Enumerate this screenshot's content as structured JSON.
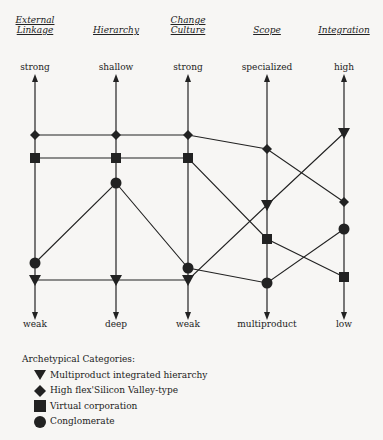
{
  "axes": [
    {
      "header": "External Linkage",
      "header_lines": [
        "External",
        "Linkage"
      ],
      "top": "strong",
      "bottom": "weak"
    },
    {
      "header": "Hierarchy",
      "header_lines": [
        "",
        "Hierarchy"
      ],
      "top": "shallow",
      "bottom": "deep"
    },
    {
      "header": "Change Culture",
      "header_lines": [
        "Change",
        "Culture"
      ],
      "top": "strong",
      "bottom": "weak"
    },
    {
      "header": "Scope",
      "header_lines": [
        "",
        "Scope"
      ],
      "top": "specialized",
      "bottom": "multiproduct"
    },
    {
      "header": "Integration",
      "header_lines": [
        "",
        "Integration"
      ],
      "top": "high",
      "bottom": "low"
    }
  ],
  "legend": {
    "title": "Archetypical Categories:",
    "items": [
      {
        "marker": "triangle-down",
        "label": "Multiproduct integrated hierarchy"
      },
      {
        "marker": "diamond",
        "label": "High flex'Silicon Valley-type"
      },
      {
        "marker": "square",
        "label": "Virtual corporation"
      },
      {
        "marker": "circle",
        "label": "Conglomerate"
      }
    ]
  },
  "profiles": {
    "axis_x": [
      35,
      116,
      188,
      267,
      344
    ],
    "series": [
      {
        "name": "Multiproduct integrated hierarchy",
        "marker": "triangle-down",
        "y": [
          280,
          280,
          280,
          205,
          133
        ]
      },
      {
        "name": "High flex'Silicon Valley-type",
        "marker": "diamond",
        "y": [
          135,
          135,
          135,
          149,
          202
        ]
      },
      {
        "name": "Virtual corporation",
        "marker": "square",
        "y": [
          158,
          158,
          158,
          239,
          277
        ]
      },
      {
        "name": "Conglomerate",
        "marker": "circle",
        "y": [
          263,
          183,
          268,
          283,
          229
        ]
      }
    ]
  },
  "colors": {
    "ink": "#222222",
    "background": "#f7f6f4"
  }
}
